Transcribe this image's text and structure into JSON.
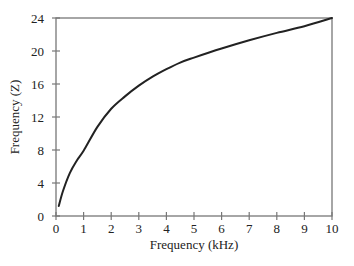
{
  "chart_data": {
    "type": "line",
    "title": "",
    "xlabel": "Frequency (kHz)",
    "ylabel": "Frequency (Z)",
    "xlim": [
      0,
      10
    ],
    "ylim": [
      0,
      24
    ],
    "x_ticks": [
      0,
      1,
      2,
      3,
      4,
      5,
      6,
      7,
      8,
      9,
      10
    ],
    "y_ticks": [
      0,
      4,
      8,
      12,
      16,
      20,
      24
    ],
    "grid": false,
    "frame": "box",
    "series": [
      {
        "name": "Z vs kHz",
        "color": "#222222",
        "x": [
          0.1,
          0.25,
          0.5,
          0.75,
          1,
          1.5,
          2,
          2.5,
          3,
          3.5,
          4,
          4.5,
          5,
          6,
          7,
          8,
          9,
          10
        ],
        "y": [
          1.2,
          3.0,
          5.2,
          6.7,
          7.9,
          10.8,
          13.0,
          14.5,
          15.8,
          16.9,
          17.8,
          18.6,
          19.2,
          20.3,
          21.3,
          22.2,
          23.0,
          24.0
        ]
      }
    ]
  },
  "colors": {
    "axis": "#777777",
    "curve": "#222222",
    "text": "#222222"
  }
}
